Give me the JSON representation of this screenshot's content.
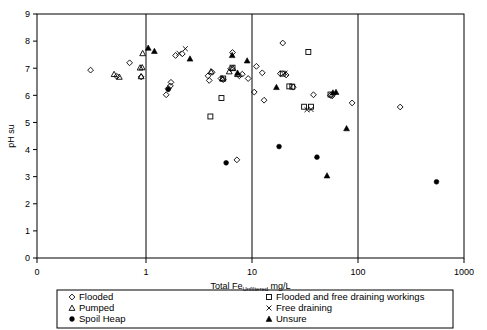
{
  "chart_data": {
    "type": "scatter",
    "title": "",
    "xlabel": "Total Fe_Unfiltered mg/L",
    "xlabel_main_pre": "Total Fe",
    "xlabel_sub": "Unfiltered",
    "xlabel_main_post": " mg/L",
    "ylabel": "pH su",
    "xscale": "log",
    "xlim": [
      0.1,
      1000
    ],
    "ylim": [
      0,
      9
    ],
    "x_tick_labels": [
      "0",
      "1",
      "10",
      "100",
      "1000"
    ],
    "x_tick_values": [
      0.1,
      1,
      10,
      100,
      1000
    ],
    "y_tick_labels": [
      "0",
      "1",
      "2",
      "3",
      "4",
      "5",
      "6",
      "7",
      "8",
      "9"
    ],
    "y_tick_values": [
      0,
      1,
      2,
      3,
      4,
      5,
      6,
      7,
      8,
      9
    ],
    "gridlines_x": [
      1,
      10,
      100
    ],
    "grid": "vertical-only",
    "legend_position": "below-plot",
    "marker_colors": {
      "stroke": "#000000",
      "fill_open": "none",
      "fill_solid": "#000000"
    },
    "series": [
      {
        "name": "Flooded",
        "marker": "open-diamond",
        "points": [
          [
            0.3,
            6.93
          ],
          [
            0.53,
            6.7
          ],
          [
            0.7,
            7.2
          ],
          [
            0.9,
            6.68
          ],
          [
            1.55,
            6.02
          ],
          [
            1.72,
            6.48
          ],
          [
            1.7,
            6.35
          ],
          [
            1.62,
            6.25
          ],
          [
            1.9,
            7.47
          ],
          [
            2.2,
            7.53
          ],
          [
            3.85,
            6.72
          ],
          [
            3.95,
            6.55
          ],
          [
            4.2,
            6.85
          ],
          [
            5.1,
            6.62
          ],
          [
            5.35,
            6.58
          ],
          [
            6.3,
            6.98
          ],
          [
            6.55,
            7.58
          ],
          [
            7.6,
            6.72
          ],
          [
            8.1,
            6.78
          ],
          [
            9.2,
            6.62
          ],
          [
            7.2,
            3.62
          ],
          [
            10.5,
            6.12
          ],
          [
            11.0,
            7.07
          ],
          [
            12.5,
            6.83
          ],
          [
            13.0,
            5.82
          ],
          [
            18.5,
            6.8
          ],
          [
            19.5,
            7.93
          ],
          [
            21.0,
            6.75
          ],
          [
            24.5,
            6.3
          ],
          [
            38.0,
            6.02
          ],
          [
            55.0,
            6.0
          ],
          [
            57.0,
            5.98
          ],
          [
            88.0,
            5.72
          ],
          [
            250.0,
            5.57
          ]
        ]
      },
      {
        "name": "Pumped",
        "marker": "open-triangle",
        "points": [
          [
            0.5,
            6.78
          ],
          [
            0.56,
            6.68
          ],
          [
            0.88,
            7.02
          ],
          [
            0.93,
            7.55
          ],
          [
            0.9,
            6.7
          ],
          [
            0.92,
            7.03
          ],
          [
            4.1,
            6.88
          ],
          [
            5.25,
            6.62
          ],
          [
            6.1,
            6.88
          ],
          [
            6.6,
            7.0
          ],
          [
            7.3,
            6.78
          ]
        ]
      },
      {
        "name": "Spoil Heap",
        "marker": "filled-circle",
        "points": [
          [
            1.62,
            6.22
          ],
          [
            5.7,
            3.51
          ],
          [
            18.0,
            4.11
          ],
          [
            41.0,
            3.72
          ],
          [
            550.0,
            2.81
          ]
        ]
      },
      {
        "name": "Flooded and free draining workings",
        "marker": "open-square",
        "points": [
          [
            4.05,
            5.22
          ],
          [
            5.15,
            5.9
          ],
          [
            6.55,
            7.02
          ],
          [
            5.35,
            6.62
          ],
          [
            19.5,
            6.8
          ],
          [
            22.5,
            6.33
          ],
          [
            24.0,
            6.32
          ],
          [
            34.0,
            7.6
          ],
          [
            31.0,
            5.58
          ],
          [
            36.0,
            5.58
          ],
          [
            55.0,
            6.03
          ]
        ]
      },
      {
        "name": "Free draining",
        "marker": "x-cross",
        "points": [
          [
            2.35,
            7.72
          ],
          [
            2.05,
            7.55
          ],
          [
            20.5,
            6.82
          ],
          [
            33.0,
            5.47
          ],
          [
            36.0,
            5.48
          ]
        ]
      },
      {
        "name": "Unsure",
        "marker": "filled-triangle",
        "points": [
          [
            1.05,
            7.75
          ],
          [
            1.2,
            7.63
          ],
          [
            2.6,
            7.35
          ],
          [
            6.5,
            7.48
          ],
          [
            7.3,
            6.83
          ],
          [
            9.0,
            7.28
          ],
          [
            17.0,
            6.3
          ],
          [
            51.0,
            3.04
          ],
          [
            58.0,
            6.1
          ],
          [
            62.0,
            6.12
          ],
          [
            78.0,
            4.78
          ]
        ]
      }
    ]
  },
  "legend": {
    "entries": [
      {
        "label": "Flooded",
        "marker": "open-diamond",
        "column": 0
      },
      {
        "label": "Pumped",
        "marker": "open-triangle",
        "column": 0
      },
      {
        "label": "Spoil Heap",
        "marker": "filled-circle",
        "column": 0
      },
      {
        "label": "Flooded and free draining workings",
        "marker": "open-square",
        "column": 1
      },
      {
        "label": "Free draining",
        "marker": "x-cross",
        "column": 1
      },
      {
        "label": "Unsure",
        "marker": "filled-triangle",
        "column": 1
      }
    ]
  }
}
